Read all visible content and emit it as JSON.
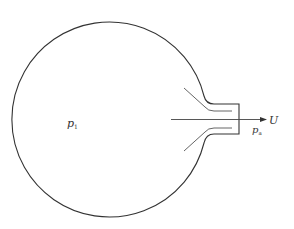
{
  "diagram": {
    "labels": {
      "inside_pressure": "p",
      "inside_pressure_sub": "1",
      "outside_pressure": "p",
      "outside_pressure_sub": "a",
      "velocity": "U"
    },
    "colors": {
      "stroke": "#333333",
      "background": "#ffffff"
    }
  }
}
